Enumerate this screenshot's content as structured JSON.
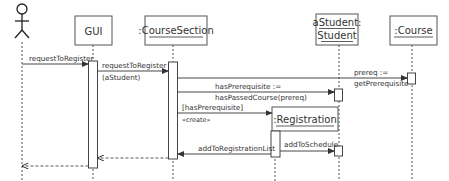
{
  "diagram": {
    "type": "UML sequence diagram",
    "actor": {
      "name": "actor"
    },
    "objects": [
      {
        "id": "gui",
        "label": "GUI",
        "underlined": false
      },
      {
        "id": "courseSection",
        "label": ":CourseSection",
        "underlined": true
      },
      {
        "id": "aStudent",
        "label_line1": "aStudent:",
        "label_line2": "Student",
        "underlined": true
      },
      {
        "id": "course",
        "label": ":Course",
        "underlined": true
      },
      {
        "id": "registration",
        "label": ":Registration",
        "underlined": true,
        "created": true
      }
    ],
    "messages": [
      {
        "from": "actor",
        "to": "gui",
        "label": "requestToRegister",
        "style": "solid"
      },
      {
        "from": "gui",
        "to": "courseSection",
        "label": "requestToRegister",
        "label2": "(aStudent)",
        "style": "solid"
      },
      {
        "from": "courseSection",
        "to": "course",
        "label": "prereq :=",
        "label2": "getPrerequisite",
        "style": "solid"
      },
      {
        "from": "courseSection",
        "to": "aStudent",
        "label": "hasPrerequisite :=",
        "label2": "hasPassedCourse(prereq)",
        "style": "solid"
      },
      {
        "from": "courseSection",
        "to": "registration",
        "label": "[hasPrerequisite]",
        "label2": "«create»",
        "style": "solid"
      },
      {
        "from": "registration",
        "to": "aStudent",
        "label": "addToSchedule",
        "style": "solid"
      },
      {
        "from": "registration",
        "to": "courseSection",
        "label": "addToRegistrationList",
        "style": "solid"
      },
      {
        "from": "courseSection",
        "to": "gui",
        "label": "",
        "style": "dashed-return"
      },
      {
        "from": "gui",
        "to": "actor",
        "label": "",
        "style": "dashed-return"
      }
    ]
  }
}
